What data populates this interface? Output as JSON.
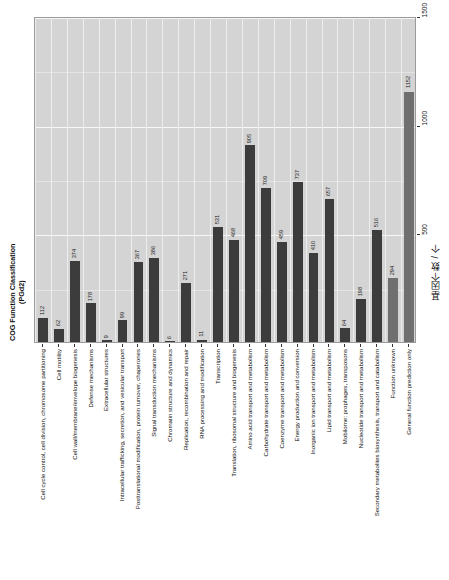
{
  "axis_titles": {
    "category_axis": "COG Function Classification (PGd2)",
    "value_axis_cn": "基因个数 / 个"
  },
  "chart_data": {
    "type": "bar",
    "title": "COG Function Classification (PGd2)",
    "xlabel": "COG Function Classification (PGd2)",
    "ylabel": "基因个数 / 个",
    "orientation": "vertical-bars-rotated-90",
    "grid": true,
    "legend": "none",
    "ylim": [
      0,
      1500
    ],
    "yticks": [
      0,
      500,
      1000,
      1500
    ],
    "ytick_labels": [
      "0",
      "500",
      "1000",
      "1500"
    ],
    "categories": [
      "Cell cycle control, cell division, chromosome partitioning",
      "Cell motility",
      "Cell wall/membrane/envelope biogenesis",
      "Defense mechanisms",
      "Extracellular structures",
      "Intracellular trafficking, secretion, and vesicular transport",
      "Posttranslational modification, protein turnover, chaperones",
      "Signal transduction mechanisms",
      "Chromatin structure and dynamics",
      "Replication, recombination and repair",
      "RNA processing and modification",
      "Transcription",
      "Translation, ribosomal structure and biogenesis",
      "Amino acid transport and metabolism",
      "Carbohydrate transport and metabolism",
      "Coenzyme transport and metabolism",
      "Energy production and conversion",
      "Inorganic ion transport and metabolism",
      "Lipid transport and metabolism",
      "Mobilome: prophages, transposons",
      "Nucleotide transport and metabolism",
      "Secondary metabolites biosynthesis, transport and catabolism",
      "Function unknown",
      "General function prediction only"
    ],
    "values": [
      112,
      62,
      374,
      178,
      9,
      99,
      367,
      386,
      6,
      271,
      11,
      531,
      468,
      905,
      709,
      459,
      737,
      410,
      657,
      64,
      198,
      516,
      294,
      1152
    ],
    "value_labels": [
      "112",
      "62",
      "374",
      "178",
      "9",
      "99",
      "367",
      "386",
      "6",
      "271",
      "11",
      "531",
      "468",
      "905",
      "709",
      "459",
      "737",
      "410",
      "657",
      "64",
      "198",
      "516",
      "294",
      "1152"
    ],
    "bar_shades": [
      "dark",
      "dark",
      "dark",
      "dark",
      "dark",
      "dark",
      "dark",
      "dark",
      "dark",
      "dark",
      "dark",
      "dark",
      "dark",
      "dark",
      "dark",
      "dark",
      "dark",
      "dark",
      "dark",
      "dark",
      "dark",
      "dark",
      "light",
      "light"
    ],
    "colors": {
      "bar_dark": "#3c3c3c",
      "bar_light": "#6f6f6f",
      "panel_background": "#d4d4d4",
      "grid": "#f2f2f2",
      "text": "#111111"
    }
  }
}
